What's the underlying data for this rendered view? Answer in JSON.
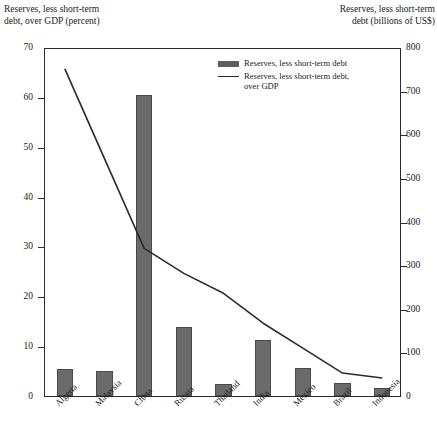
{
  "chart_data": {
    "type": "bar",
    "title": "",
    "categories": [
      "Algeria",
      "Malaysia",
      "China",
      "Russia",
      "Thailand",
      "India",
      "Mexico",
      "Brazil",
      "Indonesia"
    ],
    "series": [
      {
        "name": "Reserves, less short-term debt",
        "type": "bar",
        "axis": "right",
        "unit": "billions of US$",
        "values": [
          62,
          58,
          690,
          158,
          27,
          128,
          65,
          30,
          18
        ]
      },
      {
        "name": "Reserves, less short-term debt, over GDP",
        "type": "line",
        "axis": "left",
        "unit": "percent",
        "values": [
          66,
          48,
          30,
          25,
          21,
          15,
          10,
          5,
          4
        ]
      }
    ],
    "left_axis": {
      "label": "Reserves, less short-term\ndebt, over GDP (percent)",
      "ticks": [
        0,
        10,
        20,
        30,
        40,
        50,
        60,
        70
      ],
      "ylim": [
        0,
        70
      ]
    },
    "right_axis": {
      "label": "Reserves, less short-term\ndebt (billions of US$)",
      "ticks": [
        0,
        100,
        200,
        300,
        400,
        500,
        600,
        700,
        800
      ],
      "ylim": [
        0,
        800
      ]
    },
    "xlabel": "",
    "grid": false,
    "legend_position": "top-right-inside",
    "legend": [
      {
        "label": "Reserves, less short-term debt",
        "marker": "bar",
        "color": "#5e5e5e"
      },
      {
        "label": "Reserves, less short-term debt,\nover GDP",
        "marker": "line",
        "color": "#2b2b2b"
      }
    ],
    "colors": {
      "bar": "#6b6b6b",
      "line": "#2b2b2b",
      "axis": "#2b2b2b",
      "background": "#ffffff"
    }
  }
}
